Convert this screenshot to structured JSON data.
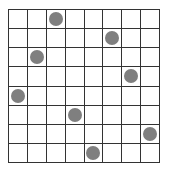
{
  "board": {
    "rows": 8,
    "cols": 8,
    "piece_color": "#7f7f7f",
    "grid_color": "#333333",
    "pieces": [
      {
        "row": 0,
        "col": 2
      },
      {
        "row": 1,
        "col": 5
      },
      {
        "row": 2,
        "col": 1
      },
      {
        "row": 3,
        "col": 6
      },
      {
        "row": 4,
        "col": 0
      },
      {
        "row": 5,
        "col": 3
      },
      {
        "row": 6,
        "col": 7
      },
      {
        "row": 7,
        "col": 4
      }
    ]
  }
}
